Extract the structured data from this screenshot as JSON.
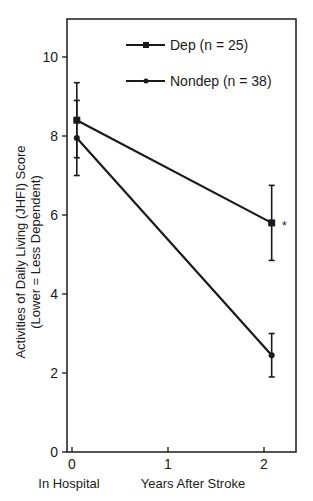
{
  "chart_data": {
    "type": "line",
    "title": "",
    "xlabel": "Years After Stroke",
    "x_sublabel": "In Hospital",
    "ylabel_line1": "Activities of Daily Living (JHFI) Score",
    "ylabel_line2": "(Lower = Less Dependent)",
    "x_ticks": [
      "0",
      "1",
      "2"
    ],
    "y_ticks": [
      "0",
      "2",
      "4",
      "6",
      "8",
      "10"
    ],
    "xlim": [
      0,
      2.35
    ],
    "ylim": [
      0,
      11
    ],
    "grid": false,
    "legend_position": "upper right inside",
    "annotation": "*",
    "series": [
      {
        "name": "Dep (n = 25)",
        "marker": "square",
        "x": [
          0.05,
          2.08
        ],
        "values": [
          8.4,
          5.8
        ],
        "error_low": [
          7.45,
          4.85
        ],
        "error_high": [
          9.35,
          6.75
        ]
      },
      {
        "name": "Nondep (n = 38)",
        "marker": "dot",
        "x": [
          0.05,
          2.08
        ],
        "values": [
          7.95,
          2.45
        ],
        "error_low": [
          7.0,
          1.9
        ],
        "error_high": [
          8.9,
          3.0
        ]
      }
    ]
  }
}
